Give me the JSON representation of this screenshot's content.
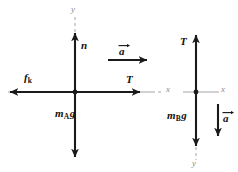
{
  "figure": {
    "type": "free-body-diagram-pair"
  },
  "diagram_a": {
    "name": "block-a-free-body-diagram",
    "axis_y_label": "y",
    "axis_x_label": "x",
    "normal_force_label": "n",
    "friction_force_symbol": "f",
    "friction_force_subscript": "k",
    "tension_label": "T",
    "weight_mass_symbol": "m",
    "weight_subscript": "A",
    "weight_g": "g",
    "acceleration_label": "a",
    "forces": [
      {
        "name": "normal",
        "label": "n",
        "direction": "up"
      },
      {
        "name": "kinetic-friction",
        "label": "f k",
        "direction": "left"
      },
      {
        "name": "tension",
        "label": "T",
        "direction": "right"
      },
      {
        "name": "weight",
        "label": "m A g",
        "direction": "down"
      }
    ],
    "acceleration_direction": "right"
  },
  "diagram_b": {
    "name": "block-b-free-body-diagram",
    "axis_y_label": "y",
    "axis_x_label": "x",
    "tension_label": "T",
    "weight_mass_symbol": "m",
    "weight_subscript": "B",
    "weight_g": "g",
    "acceleration_label": "a",
    "forces": [
      {
        "name": "tension",
        "label": "T",
        "direction": "up"
      },
      {
        "name": "weight",
        "label": "m B g",
        "direction": "down"
      }
    ],
    "acceleration_direction": "down"
  },
  "colors": {
    "force_stroke": "#1a1a1a",
    "axis_stroke": "#9a9a9a",
    "background": "#ffffff",
    "text": "#111111",
    "axis_text": "#8d8d8d"
  }
}
